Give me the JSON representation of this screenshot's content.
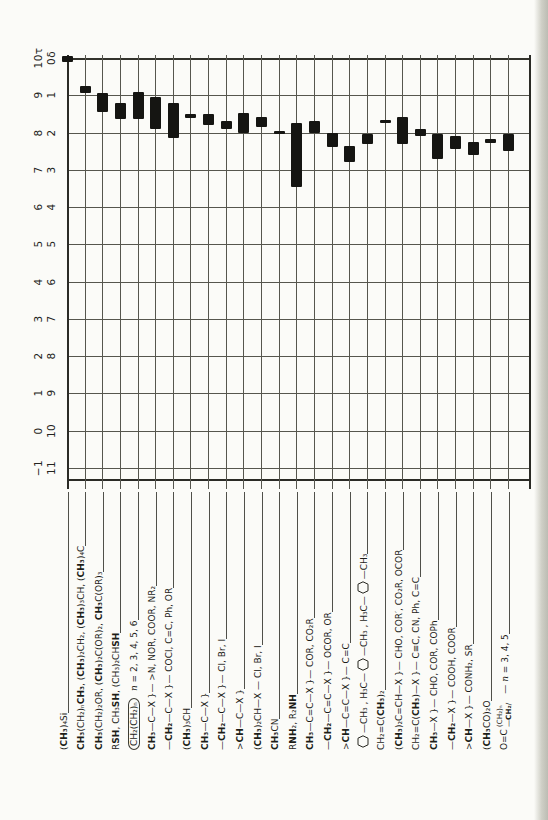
{
  "page": {
    "bg": "#fbfbf8",
    "edge_color": "#c9c9c0"
  },
  "chart_data": {
    "type": "bar",
    "variant": "range-bars-on-compound-lines",
    "title": "",
    "layout": {
      "rotated_scan": true,
      "tau_axis": "vertical, 10τ at top to −1 at bottom, on left edge",
      "delta_axis": "vertical, 0δ at top to 11 at bottom, second column",
      "grid": true,
      "labels": "rotated 90°, below chart, one per compound line"
    },
    "axes": {
      "tau": {
        "symbol": "τ",
        "ticks": [
          "10τ",
          "9",
          "8",
          "7",
          "6",
          "5",
          "4",
          "3",
          "2",
          "1",
          "0",
          "−1"
        ],
        "range": [
          10,
          -1
        ]
      },
      "delta": {
        "symbol": "δ",
        "ticks": [
          "0δ",
          "1",
          "2",
          "3",
          "4",
          "5",
          "6",
          "7",
          "8",
          "9",
          "10",
          "11"
        ],
        "range": [
          0,
          11
        ]
      }
    },
    "compounds": [
      {
        "f": "(*CH₃*)₄Si",
        "delta": [
          -0.06,
          0.12
        ]
      },
      {
        "f": "*CH₃*(CH₂)ₙ*CH₃*, (*CH₃*)₂CH₂, (*CH₃*)₃CH, (*CH₃*)₄C",
        "delta": [
          0.75,
          0.95
        ]
      },
      {
        "f": "*CH₃*(CH₂)₂OR, (*CH₃*)₂C(OR)₂, *CH₃*C(OR)₃",
        "delta": [
          0.95,
          1.45
        ]
      },
      {
        "f": "R*SH*, CH₃*SH*, (CH₃)₂CH*SH*",
        "delta": [
          1.2,
          1.65
        ]
      },
      {
        "enc": "CH₂(CH₂)ₙ",
        "note": "n = 2, 3, 4, 5, 6",
        "delta": [
          0.9,
          1.65
        ]
      },
      {
        "f": "*CH₃*—C—X }— >N, NOR, COOR, NR₂",
        "delta": [
          1.05,
          1.9
        ]
      },
      {
        "f": "—*CH₂*—C—X }— COCl, C=C, Ph, OR",
        "delta": [
          1.2,
          2.15
        ]
      },
      {
        "f": "(*CH₃*)₃CH",
        "delta": [
          1.5,
          1.62
        ]
      },
      {
        "f": "*CH₃*—C—X }",
        "delta": [
          1.5,
          1.8
        ]
      },
      {
        "f": "—*CH₂*—C—X }— Cl, Br, I",
        "delta": [
          1.7,
          1.9
        ]
      },
      {
        "f": ">*CH*—C—X }",
        "delta": [
          1.48,
          2.0
        ]
      },
      {
        "f": "(*CH₃*)₂CH—X — Cl, Br, I",
        "delta": [
          1.58,
          1.85
        ]
      },
      {
        "f": "*CH₃*CN",
        "delta": [
          1.95,
          2.03
        ]
      },
      {
        "f": "R*NH*₂, R₂*NH*",
        "delta": [
          1.75,
          3.45
        ]
      },
      {
        "f": "*CH₃*—C=C—X }— COR, CO₂R",
        "delta": [
          1.7,
          2.0
        ]
      },
      {
        "f": "—*CH₂*—C=C—X }— OCOR, OR",
        "delta": [
          2.0,
          2.4
        ]
      },
      {
        "f": ">*CH*—C=C—X }— C=C",
        "delta": [
          2.35,
          2.8
        ]
      },
      {
        "hex": [
          "",
          "—CH₃ ,  H₃C—",
          "—CH₃ ,  H₃C—",
          "—CH₃"
        ],
        "delta": [
          2.05,
          2.3
        ]
      },
      {
        "f": "CH₂=C(*CH₃*)₂",
        "delta": [
          1.66,
          1.74
        ]
      },
      {
        "f": "(*CH₃*)₂C=CH—X }— CHO, COR′, CO₂R, OCOR",
        "delta": [
          1.58,
          2.32
        ]
      },
      {
        "f": "CH₂=C(*CH₃*)—X }— C≡C, CN, Ph, C=C",
        "delta": [
          1.9,
          2.1
        ]
      },
      {
        "f": "*CH₃*—X }— CHO, COR, COPh",
        "delta": [
          2.05,
          2.7
        ]
      },
      {
        "f": "—*CH₂*—X }— COOH, COOR",
        "delta": [
          2.1,
          2.45
        ]
      },
      {
        "f": ">*CH*—X }— CONH₂, SR",
        "delta": [
          2.25,
          2.6
        ]
      },
      {
        "f": "(*CH₃*CO)₂O",
        "delta": [
          2.18,
          2.27
        ]
      },
      {
        "stack": {
          "pre": "O=C",
          "top": "(CH₂)ₙ",
          "bottom": "—*CH₂*/"
        },
        "note": "— n = 3, 4, 5",
        "delta": [
          2.05,
          2.5
        ]
      }
    ]
  }
}
